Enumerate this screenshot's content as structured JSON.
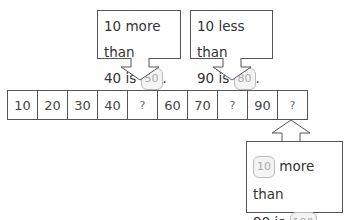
{
  "number_strip": {
    "cells": [
      "10",
      "20",
      "30",
      "40",
      "?",
      "60",
      "70",
      "?",
      "90",
      "?"
    ]
  },
  "callouts": [
    {
      "line1": "10 more than",
      "line2_prefix": "40 is",
      "answer": "50",
      "suffix": ".",
      "arrow_direction": "down",
      "points_to_cell": 5
    },
    {
      "line1": "10 less than",
      "line2_prefix": "90 is",
      "answer": "80",
      "suffix": ".",
      "arrow_direction": "down",
      "points_to_cell": 8
    },
    {
      "line1_answer": "10",
      "line1": "more than",
      "line2_prefix": "90 is",
      "answer": "100",
      "suffix": ".",
      "arrow_direction": "up",
      "points_to_cell": 10
    }
  ],
  "colors": {
    "border": "#555555",
    "answer_text": "#aaaaaa",
    "answer_bg": "#f4f4f4"
  }
}
